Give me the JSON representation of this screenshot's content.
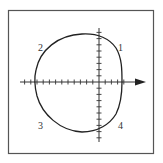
{
  "diagram": {
    "type": "polar-curve-plot",
    "frame": {
      "x": 8,
      "y": 10,
      "width": 146,
      "height": 144,
      "stroke": "#555555"
    },
    "axes": {
      "origin": {
        "x": 99,
        "y": 82
      },
      "x_axis": {
        "from": 20,
        "to": 146,
        "arrow": "right",
        "tick_spacing": 6.2,
        "ticks_left": 12,
        "ticks_right": 4
      },
      "y_axis": {
        "from": 28,
        "to": 142,
        "tick_spacing": 6.2,
        "ticks_up": 8,
        "ticks_down": 9
      },
      "color": "#333333"
    },
    "curve": {
      "description": "closed loop crossing all four quadrants, wider on left, flatter on right",
      "stroke": "#222222",
      "stroke_width": 1.3
    },
    "quadrant_labels": [
      {
        "text": "1",
        "x": 118,
        "y": 51
      },
      {
        "text": "2",
        "x": 38,
        "y": 51
      },
      {
        "text": "3",
        "x": 38,
        "y": 129
      },
      {
        "text": "4",
        "x": 118,
        "y": 129
      }
    ]
  }
}
